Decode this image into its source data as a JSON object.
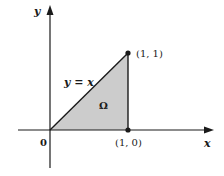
{
  "diagram": {
    "axes": {
      "x_label": "x",
      "y_label": "y",
      "origin_label": "0"
    },
    "points": [
      {
        "id": "p10",
        "label": "(1, 0)",
        "x": 1,
        "y": 0
      },
      {
        "id": "p11",
        "label": "(1, 1)",
        "x": 1,
        "y": 1
      }
    ],
    "line_label": "y = x",
    "region_label": "Ω",
    "colors": {
      "region_fill": "#cccccc",
      "stroke": "#1a1a1a",
      "background": "#ffffff"
    }
  }
}
